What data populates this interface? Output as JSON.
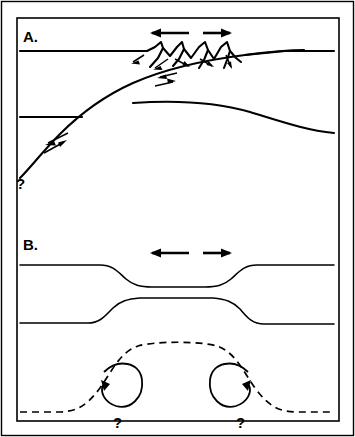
{
  "figure": {
    "width": 355,
    "height": 437,
    "background_color": "#ffffff",
    "line_color": "#000000"
  },
  "panels": [
    {
      "id": "panel-a",
      "label": "A.",
      "model_name": "simple-shear-detachment",
      "extension_arrows": {
        "left_label": "left-extension-arrow",
        "right_label": "right-extension-arrow",
        "direction": "divergent"
      },
      "fault_blocks_count": 4,
      "shear_sense_couples": 2,
      "question_mark": "?",
      "question_mark_position": "lower-left-detachment-tip"
    },
    {
      "id": "panel-b",
      "label": "B.",
      "model_name": "pure-shear-necking",
      "extension_arrows": {
        "left_label": "left-extension-arrow",
        "right_label": "right-extension-arrow",
        "direction": "divergent"
      },
      "convection_cells": [
        {
          "name": "left-convection-cell",
          "rotation": "counterclockwise",
          "question_mark": "?"
        },
        {
          "name": "right-convection-cell",
          "rotation": "clockwise",
          "question_mark": "?"
        }
      ],
      "asthenosphere_boundary_style": "dashed"
    }
  ],
  "labels": {
    "panel_a": "A.",
    "panel_b": "B.",
    "question_mark": "?"
  }
}
